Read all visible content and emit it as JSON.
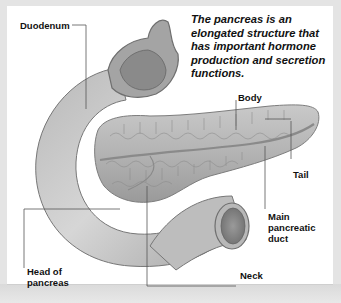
{
  "figure": {
    "caption": "The pancreas is an elongated structure that has important hormone production and secretion functions.",
    "labels": {
      "duodenum": "Duodenum",
      "body": "Body",
      "tail": "Tail",
      "main_duct_line1": "Main",
      "main_duct_line2": "pancreatic",
      "main_duct_line3": "duct",
      "neck": "Neck",
      "head_line1": "Head of",
      "head_line2": "pancreas"
    },
    "colors": {
      "frame": "#e4e4e4",
      "panel": "#ffffff",
      "tissue_light": "#d4d4d4",
      "tissue_mid": "#a9a9a9",
      "tissue_dark": "#7a7a7a",
      "leader_line": "#555555"
    }
  }
}
